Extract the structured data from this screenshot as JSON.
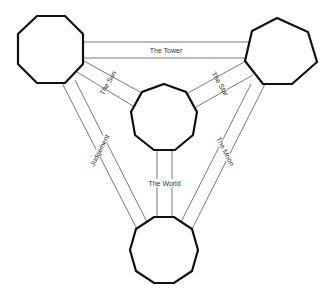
{
  "diagram": {
    "type": "graph",
    "nodes": [
      {
        "id": "octagon",
        "shape": "octagon",
        "sides": 8,
        "cx": 50,
        "cy": 50
      },
      {
        "id": "heptagon",
        "shape": "heptagon",
        "sides": 7,
        "cx": 282,
        "cy": 52
      },
      {
        "id": "nonagon",
        "shape": "nonagon",
        "sides": 9,
        "cx": 164,
        "cy": 118
      },
      {
        "id": "decagon",
        "shape": "decagon",
        "sides": 10,
        "cx": 164,
        "cy": 250
      }
    ],
    "edges": [
      {
        "from": "octagon",
        "to": "heptagon",
        "label": "The Tower"
      },
      {
        "from": "octagon",
        "to": "nonagon",
        "label": "The Sun"
      },
      {
        "from": "heptagon",
        "to": "nonagon",
        "label": "The Star"
      },
      {
        "from": "octagon",
        "to": "decagon",
        "label": "Judgement"
      },
      {
        "from": "heptagon",
        "to": "decagon",
        "label": "The Moon"
      },
      {
        "from": "nonagon",
        "to": "decagon",
        "label": "The World"
      }
    ]
  }
}
